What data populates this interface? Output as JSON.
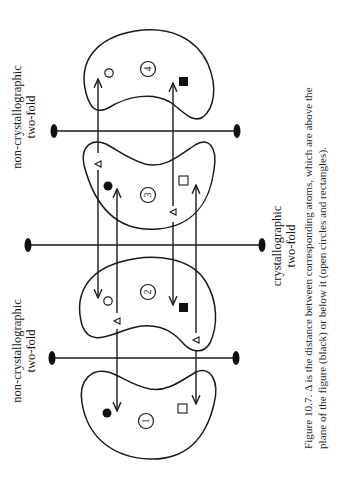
{
  "figure": {
    "number": "Figure 10.7.",
    "caption_line1": "Figure 10.7.  Δ is the distance between corresponding atoms, which are above the",
    "caption_line2": "plane of the figure (black) or below it (open circles and rectangles).",
    "labels": {
      "top_axis_line1": "non-crystallographic",
      "top_axis_line2": "two-fold",
      "bottom_axis_line1": "non-crystallographic",
      "bottom_axis_line2": "two-fold",
      "middle_axis_line1": "crystallographic",
      "middle_axis_line2": "two-fold"
    },
    "molecules": [
      {
        "id": "4",
        "label": "4",
        "atoms": [
          "open-circle",
          "filled-square"
        ]
      },
      {
        "id": "3",
        "label": "3",
        "atoms": [
          "filled-circle",
          "open-square"
        ]
      },
      {
        "id": "2",
        "label": "2",
        "atoms": [
          "open-circle",
          "filled-square"
        ]
      },
      {
        "id": "1",
        "label": "1",
        "atoms": [
          "filled-circle",
          "open-square"
        ]
      }
    ],
    "delta_symbol": "Δ",
    "colors": {
      "ink": "#1a1a1a",
      "background": "#ffffff"
    }
  }
}
